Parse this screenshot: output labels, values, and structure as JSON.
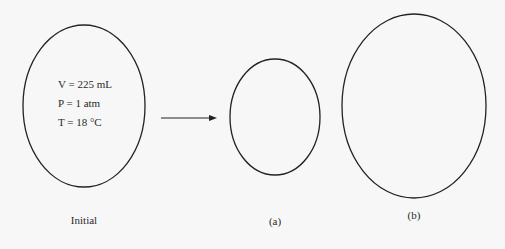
{
  "diagram": {
    "containers": [
      {
        "id": "initial",
        "label": "Initial",
        "cx": 84,
        "cy": 106,
        "rx": 61,
        "ry": 81,
        "conditions": [
          "V = 225 mL",
          "P = 1 atm",
          "T = 18 °C"
        ]
      },
      {
        "id": "a",
        "label": "(a)",
        "cx": 275,
        "cy": 117,
        "rx": 45,
        "ry": 58
      },
      {
        "id": "b",
        "label": "(b)",
        "cx": 414,
        "cy": 106,
        "rx": 72,
        "ry": 92
      }
    ],
    "arrow": {
      "x1": 161,
      "y1": 118,
      "x2": 216,
      "y2": 118
    },
    "stroke_color": "#222222",
    "background": "#f7f7f7"
  }
}
